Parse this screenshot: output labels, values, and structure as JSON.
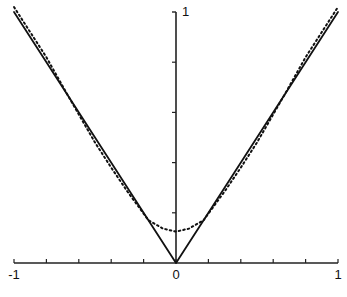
{
  "chart_data": {
    "type": "line",
    "title": "",
    "xlabel": "",
    "ylabel": "",
    "xlim": [
      -1,
      1
    ],
    "ylim": [
      0,
      1
    ],
    "grid": false,
    "legend": null,
    "x_tick_labels": [
      {
        "value": -1,
        "label": "-1"
      },
      {
        "value": 0,
        "label": "0"
      },
      {
        "value": 1,
        "label": "1"
      }
    ],
    "x_minor_ticks": [
      -0.8,
      -0.6,
      -0.4,
      -0.2,
      0.2,
      0.4,
      0.6,
      0.8
    ],
    "y_tick_labels": [
      {
        "value": 1,
        "label": "1"
      }
    ],
    "y_minor_ticks": [
      0.2,
      0.4,
      0.6,
      0.8
    ],
    "series": [
      {
        "name": "|x|",
        "style": "solid",
        "color": "#111111",
        "x": [
          -1,
          0,
          1
        ],
        "y": [
          1,
          0,
          1
        ]
      },
      {
        "name": "approximation",
        "style": "dotted",
        "color": "#111111",
        "x": [
          -1,
          -0.9,
          -0.8,
          -0.67,
          -0.5,
          -0.4,
          -0.3,
          -0.17,
          -0.08,
          0,
          0.08,
          0.17,
          0.3,
          0.4,
          0.5,
          0.67,
          0.8,
          0.9,
          1
        ],
        "y": [
          1.02,
          0.92,
          0.82,
          0.67,
          0.48,
          0.38,
          0.285,
          0.17,
          0.137,
          0.125,
          0.137,
          0.17,
          0.285,
          0.38,
          0.48,
          0.67,
          0.82,
          0.92,
          1.02
        ]
      }
    ]
  }
}
